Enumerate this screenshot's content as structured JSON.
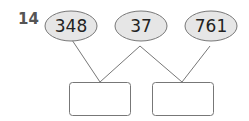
{
  "question": {
    "number": "14",
    "ovals": [
      {
        "value": "348"
      },
      {
        "value": "37"
      },
      {
        "value": "761"
      }
    ],
    "answer_boxes": [
      {
        "value": ""
      },
      {
        "value": ""
      }
    ]
  },
  "colors": {
    "oval_fill": "#e6e6e6",
    "stroke": "#777777"
  }
}
